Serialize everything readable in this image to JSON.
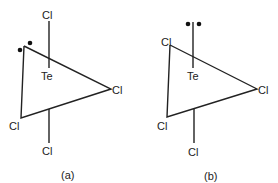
{
  "figure": {
    "panels": [
      {
        "id": "a",
        "caption": "(a)",
        "central_atom": "Te",
        "ligands": {
          "top": "Cl",
          "right": "Cl",
          "bottom_left": "Cl",
          "bottom": "Cl"
        },
        "lone_pair_position": "equatorial vertex (upper-left)"
      },
      {
        "id": "b",
        "caption": "(b)",
        "central_atom": "Te",
        "ligands": {
          "upper_left": "Cl",
          "right": "Cl",
          "bottom_left": "Cl",
          "bottom": "Cl"
        },
        "lone_pair_position": "axial (top)"
      }
    ],
    "colors": {
      "ink": "#222222",
      "background": "#ffffff"
    }
  }
}
